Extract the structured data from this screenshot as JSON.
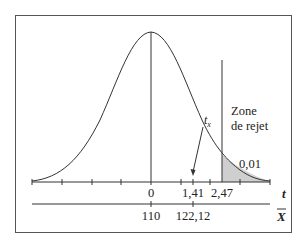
{
  "figure": {
    "type": "normal-distribution-rejection-region",
    "colors": {
      "stroke": "#333333",
      "shade": "#cfcfcf",
      "frame": "#555555",
      "background": "#ffffff"
    },
    "labels": {
      "rejection_zone_line1": "Zone",
      "rejection_zone_line2": "de rejet",
      "alpha": "0,01",
      "t_stat_label": "t",
      "t_stat_subscript": "x",
      "t_axis_label": "t",
      "xbar_axis_label": "X"
    },
    "t_axis": {
      "ticks": [
        {
          "value": "0",
          "x": 151
        },
        {
          "value": "1,41",
          "x": 193
        },
        {
          "value": "2,47",
          "x": 222
        }
      ]
    },
    "xbar_axis": {
      "ticks": [
        {
          "value": "110",
          "x": 151
        },
        {
          "value": "122,12",
          "x": 193
        }
      ]
    }
  }
}
